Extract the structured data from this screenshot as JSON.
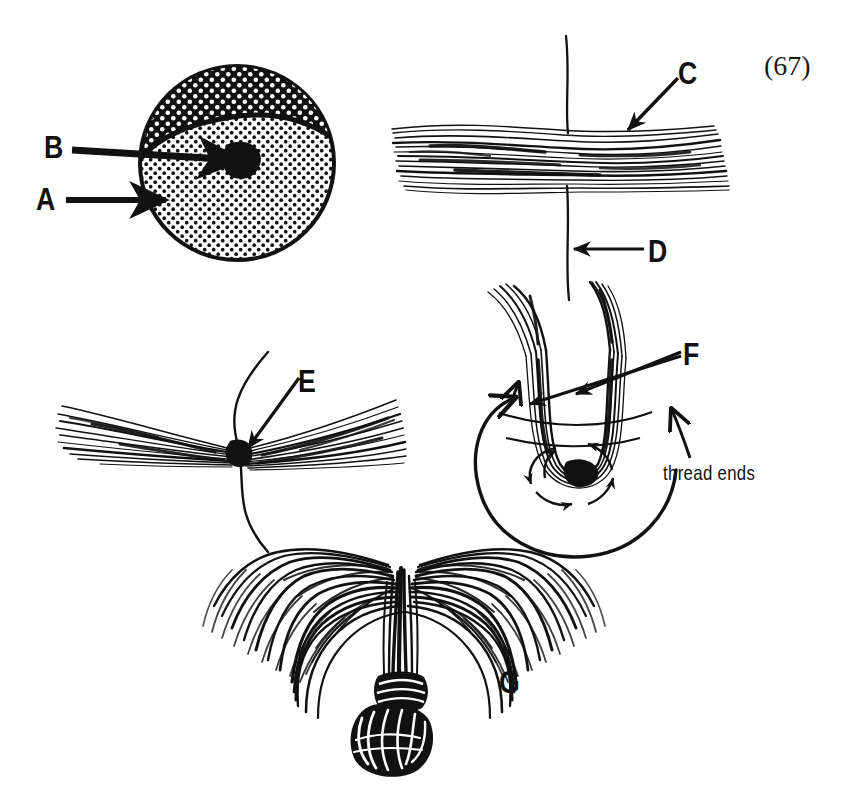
{
  "figure": {
    "number": "(67)",
    "background_color": "#ffffff",
    "ink_color": "#111111"
  },
  "labels": {
    "a": "A",
    "b": "B",
    "c": "C",
    "d": "D",
    "e": "E",
    "f": "F",
    "g": "G",
    "thread_ends": "thread ends"
  },
  "panels": [
    {
      "id": "panel-hair-butt-cross-section",
      "name": "stippled-disc",
      "position": "top-left",
      "callouts": [
        {
          "key": "a",
          "label": "A",
          "points_to": "outer stippled rim of disc"
        },
        {
          "key": "b",
          "label": "B",
          "points_to": "dark core at centre of disc"
        }
      ]
    },
    {
      "id": "panel-fiber-bundle-over-thread",
      "name": "horizontal-fiber-bundle",
      "position": "top-right",
      "callouts": [
        {
          "key": "c",
          "label": "C",
          "points_to": "hair fibre bundle"
        },
        {
          "key": "d",
          "label": "D",
          "points_to": "vertical thread"
        }
      ]
    },
    {
      "id": "panel-cinched-bundle",
      "name": "v-shaped-cinched-bundle",
      "position": "middle-left",
      "callouts": [
        {
          "key": "e",
          "label": "E",
          "points_to": "cinch point where thread binds fibres"
        }
      ]
    },
    {
      "id": "panel-thread-wrap-loop",
      "name": "u-loop-with-thread-wraps",
      "position": "middle-right",
      "callouts": [
        {
          "key": "f",
          "label": "F",
          "points_to": "doubled hair legs"
        },
        {
          "key": "thread_ends",
          "label": "thread ends",
          "points_to": "free ends of the tying thread"
        }
      ]
    },
    {
      "id": "panel-finished-flared-head",
      "name": "flared-hair-head-with-knot",
      "position": "bottom-centre",
      "callouts": [
        {
          "key": "g",
          "label": "G",
          "points_to": "finished flared hair head"
        }
      ]
    }
  ]
}
